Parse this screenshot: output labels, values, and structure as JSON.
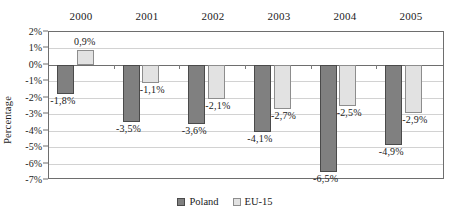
{
  "chart_data": {
    "type": "bar",
    "title": "",
    "subtitle": "",
    "xlabel": "",
    "ylabel": "Percentage",
    "categories": [
      "2000",
      "2001",
      "2002",
      "2003",
      "2004",
      "2005"
    ],
    "series": [
      {
        "name": "Poland",
        "color": "#808080",
        "values": [
          -1.8,
          -3.5,
          -3.6,
          -4.1,
          -6.5,
          -4.9
        ],
        "labels": [
          "-1,8%",
          "-3,5%",
          "-3,6%",
          "-4,1%",
          "-6,5%",
          "-4,9%"
        ]
      },
      {
        "name": "EU-15",
        "color": "#e2e2e2",
        "values": [
          0.9,
          -1.1,
          -2.1,
          -2.7,
          -2.5,
          -2.9
        ],
        "labels": [
          "0,9%",
          "-1,1%",
          "-2,1%",
          "-2,7%",
          "-2,5%",
          "-2,9%"
        ]
      }
    ],
    "ylim": [
      -7,
      2
    ],
    "ytick_values": [
      2,
      1,
      0,
      -1,
      -2,
      -3,
      -4,
      -5,
      -6,
      -7
    ],
    "ytick_labels": [
      "2%",
      "1%",
      "0%",
      "-1%",
      "-2%",
      "-3%",
      "-4%",
      "-5%",
      "-6%",
      "-7%"
    ],
    "grid": true,
    "grid_axis": "y",
    "legend_position": "bottom-center",
    "category_axis_position": "top",
    "legend": [
      "Poland",
      "EU-15"
    ]
  }
}
